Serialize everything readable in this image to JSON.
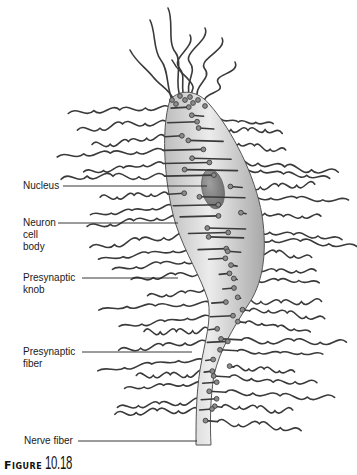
{
  "figure": {
    "caption_word": "Figure",
    "caption_number": "10.18",
    "labels": [
      {
        "id": "nucleus",
        "text": "Nucleus"
      },
      {
        "id": "neuron-cell-body",
        "text": "Neuron\ncell\nbody"
      },
      {
        "id": "presynaptic-knob",
        "text": "Presynaptic\nknob"
      },
      {
        "id": "presynaptic-fiber",
        "text": "Presynaptic\nfiber"
      },
      {
        "id": "nerve-fiber",
        "text": "Nerve fiber"
      }
    ]
  },
  "colors": {
    "cell_fill_light": "#e6e6e6",
    "cell_fill_dark": "#b3b3b3",
    "nucleus": "#8a8a8a",
    "fiber_stroke": "#3a3a3a",
    "text": "#1a1a1a"
  }
}
